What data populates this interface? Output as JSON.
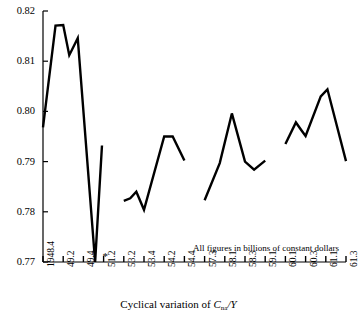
{
  "chart_data": {
    "type": "line",
    "title": "",
    "xlabel": "Cyclical variation of Cna/Y",
    "xlabel_parts": {
      "prefix": "Cyclical variation of ",
      "symbol": "C",
      "subscript": "na",
      "suffix": "/Y"
    },
    "ylabel": "",
    "ylim": [
      0.77,
      0.82
    ],
    "yticks": [
      "0.82",
      "0.81",
      "0.80",
      "0.79",
      "0.78",
      "0.77"
    ],
    "ytick_values": [
      0.82,
      0.81,
      0.8,
      0.79,
      0.78,
      0.77
    ],
    "categories": [
      "1948.4",
      "49.2",
      "49.4",
      "51.2",
      "53.2",
      "53.4",
      "54.2",
      "54.4",
      "57.3",
      "58.1",
      "58.3",
      "59.1",
      "60.1",
      "60.3",
      "61.1",
      "61.3"
    ],
    "grid": false,
    "legend": null,
    "annotations": [
      {
        "text": "All figures in billions of constant dollars",
        "x": 0.55,
        "y": 0.772
      },
      {
        "text": "*",
        "x_tick": "51.2",
        "y": 0.7702
      }
    ],
    "series": [
      {
        "name": "segment-1",
        "points": [
          {
            "x": 0.0,
            "y": 0.7968
          },
          {
            "x": 0.62,
            "y": 0.8171
          },
          {
            "x": 1.0,
            "y": 0.8172
          },
          {
            "x": 1.3,
            "y": 0.8112
          },
          {
            "x": 1.72,
            "y": 0.8146
          },
          {
            "x": 2.58,
            "y": 0.77
          },
          {
            "x": 2.92,
            "y": 0.7932
          }
        ]
      },
      {
        "name": "segment-2",
        "points": [
          {
            "x": 4.0,
            "y": 0.7822
          },
          {
            "x": 4.32,
            "y": 0.7827
          },
          {
            "x": 4.62,
            "y": 0.784
          },
          {
            "x": 5.0,
            "y": 0.7804
          },
          {
            "x": 6.0,
            "y": 0.795
          },
          {
            "x": 6.42,
            "y": 0.795
          },
          {
            "x": 7.0,
            "y": 0.7902
          }
        ]
      },
      {
        "name": "segment-3",
        "points": [
          {
            "x": 8.0,
            "y": 0.7823
          },
          {
            "x": 8.75,
            "y": 0.7897
          },
          {
            "x": 9.35,
            "y": 0.7996
          },
          {
            "x": 10.0,
            "y": 0.79
          },
          {
            "x": 10.45,
            "y": 0.7884
          },
          {
            "x": 11.0,
            "y": 0.7902
          }
        ]
      },
      {
        "name": "segment-4",
        "points": [
          {
            "x": 12.0,
            "y": 0.7935
          },
          {
            "x": 12.52,
            "y": 0.7978
          },
          {
            "x": 12.8,
            "y": 0.7962
          },
          {
            "x": 13.0,
            "y": 0.7951
          },
          {
            "x": 13.75,
            "y": 0.803
          },
          {
            "x": 14.08,
            "y": 0.8044
          },
          {
            "x": 15.0,
            "y": 0.7901
          }
        ]
      }
    ]
  },
  "axes": {
    "plot_left": 43,
    "plot_right": 346,
    "plot_top": 11,
    "plot_bottom": 262,
    "x_index_max": 15
  }
}
